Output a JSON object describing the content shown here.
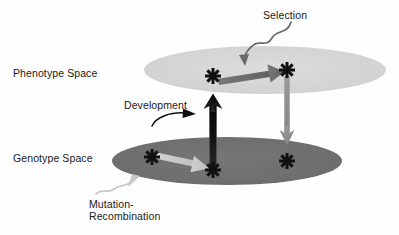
{
  "diagram": {
    "labels": {
      "phenotype_space": "Phenotype Space",
      "genotype_space": "Genotype Space",
      "selection": "Selection",
      "development": "Development",
      "mutation_line1": "Mutation-",
      "mutation_line2": "Recombination"
    },
    "colors": {
      "background": "#fefefe",
      "phenotype_plane": "#d4d4d4",
      "genotype_plane": "#6e6e6e",
      "selection_arrow": "#6b6b6b",
      "development_arrow": "#111111",
      "descent_arrow": "#8d8d8d",
      "mutation_arrow": "#c8c8c8",
      "star": "#111111",
      "text": "#1a1a1a",
      "pointer_selection": "#6b6b6b",
      "pointer_development": "#111111",
      "pointer_mutation": "#c8c8c8"
    },
    "planes": [
      {
        "name": "phenotype-plane",
        "label": "Phenotype Space",
        "shape": "ellipse",
        "cx": 265,
        "cy": 70,
        "rx": 121,
        "ry": 24,
        "fill": "#d4d4d4"
      },
      {
        "name": "genotype-plane",
        "label": "Genotype Space",
        "shape": "ellipse",
        "cx": 227,
        "cy": 161,
        "rx": 115,
        "ry": 24,
        "fill": "#6e6e6e"
      }
    ],
    "points": [
      {
        "name": "phenotype-point-start",
        "plane": "phenotype",
        "x": 213,
        "y": 76
      },
      {
        "name": "phenotype-point-selected",
        "plane": "phenotype",
        "x": 287,
        "y": 70
      },
      {
        "name": "genotype-point-parent",
        "plane": "genotype",
        "x": 152,
        "y": 157
      },
      {
        "name": "genotype-point-mutant",
        "plane": "genotype",
        "x": 213,
        "y": 170
      },
      {
        "name": "genotype-point-descendant",
        "plane": "genotype",
        "x": 287,
        "y": 161
      }
    ],
    "arrows": [
      {
        "name": "selection-arrow",
        "process": "Selection",
        "from": [
          213,
          76
        ],
        "to": [
          287,
          70
        ],
        "color": "#6b6b6b",
        "plane": "phenotype"
      },
      {
        "name": "development-arrow",
        "process": "Development",
        "from": [
          213,
          170
        ],
        "to": [
          213,
          95
        ],
        "color": "#111111",
        "direction": "genotype-to-phenotype"
      },
      {
        "name": "descent-arrow",
        "process": "Selection outcome",
        "from": [
          287,
          78
        ],
        "to": [
          287,
          142
        ],
        "color": "#8d8d8d",
        "direction": "phenotype-to-genotype"
      },
      {
        "name": "mutation-recombination-arrow",
        "process": "Mutation-Recombination",
        "from": [
          152,
          157
        ],
        "to": [
          213,
          170
        ],
        "color": "#c8c8c8",
        "plane": "genotype"
      }
    ]
  }
}
